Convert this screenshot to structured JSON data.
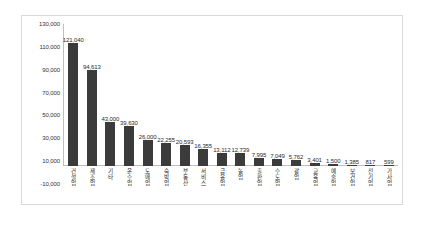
{
  "chart_data": {
    "type": "bar",
    "title": "",
    "subtitle": "",
    "xlabel": "",
    "ylabel": "",
    "ylim": [
      -10000,
      130000
    ],
    "ytick_step": 20000,
    "ytick_labels": [
      "130,000",
      "110,000",
      "90,000",
      "70,000",
      "50,000",
      "30,000",
      "10,000",
      "-10,000"
    ],
    "ytick_values": [
      130000,
      110000,
      90000,
      70000,
      50000,
      30000,
      10000,
      -10000
    ],
    "grid": false,
    "legend": "none",
    "bar_color": "#3b3b3b",
    "categories": [
      "건설업",
      "제조업",
      "기타",
      "운수업",
      "도매업",
      "숙박업",
      "부동산",
      "서비스",
      "금융업",
      "농업",
      "출판업",
      "수도업",
      "광업",
      "교육업",
      "예술업",
      "보건업",
      "전기업",
      "가사업"
    ],
    "values": [
      121040,
      94613,
      43000,
      39630,
      26000,
      22255,
      20593,
      16355,
      13112,
      12739,
      7995,
      7049,
      5762,
      3401,
      1500,
      1385,
      817,
      599
    ],
    "value_labels": [
      "121,040",
      "94,613",
      "43,000",
      "39,630",
      "26,000",
      "22,255",
      "20,593",
      "16,355",
      "13,112",
      "12,739",
      "7,995",
      "7,049",
      "5,762",
      "3,401",
      "1,500",
      "1,385",
      "817",
      "599"
    ]
  }
}
